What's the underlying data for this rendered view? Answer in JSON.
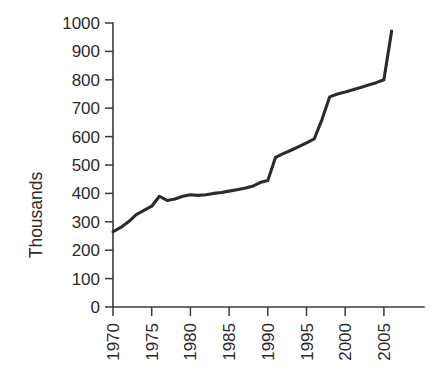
{
  "chart_data": {
    "type": "line",
    "title": "",
    "subtitle": "",
    "xlabel": "",
    "ylabel": "Thousands",
    "xlim": [
      1970,
      2006
    ],
    "ylim": [
      0,
      1000
    ],
    "grid": false,
    "legend": false,
    "legend_position": "none",
    "line_color": "#2b2b2b",
    "axis_color": "#3a3a3a",
    "background_color": "#ffffff",
    "x_tick_labels": [
      "1970",
      "1975",
      "1980",
      "1985",
      "1990",
      "1995",
      "2000",
      "2005"
    ],
    "x_tick_values": [
      1970,
      1975,
      1980,
      1985,
      1990,
      1995,
      2000,
      2005
    ],
    "x_tick_rotation": -90,
    "y_tick_labels": [
      "0",
      "100",
      "200",
      "300",
      "400",
      "500",
      "600",
      "700",
      "800",
      "900",
      "1000"
    ],
    "y_tick_values": [
      0,
      100,
      200,
      300,
      400,
      500,
      600,
      700,
      800,
      900,
      1000
    ],
    "series": [
      {
        "name": "Thousands",
        "x": [
          1970,
          1971,
          1972,
          1973,
          1974,
          1975,
          1976,
          1977,
          1978,
          1979,
          1980,
          1981,
          1982,
          1983,
          1984,
          1985,
          1986,
          1987,
          1988,
          1989,
          1990,
          1991,
          1992,
          1993,
          1994,
          1995,
          1996,
          1997,
          1998,
          1999,
          2000,
          2001,
          2002,
          2003,
          2004,
          2005,
          2006
        ],
        "values": [
          265,
          280,
          300,
          325,
          340,
          355,
          390,
          375,
          380,
          390,
          395,
          393,
          395,
          400,
          403,
          408,
          413,
          418,
          425,
          438,
          445,
          527,
          540,
          552,
          565,
          578,
          592,
          660,
          740,
          750,
          757,
          765,
          773,
          782,
          790,
          800,
          972
        ]
      }
    ]
  },
  "plot_geometry": {
    "x_axis_pixel_left": 113,
    "x_axis_pixel_right": 420,
    "y_axis_pixel_top": 23,
    "y_axis_pixel_bottom": 307,
    "pixels_per_5_years": 38.7
  }
}
